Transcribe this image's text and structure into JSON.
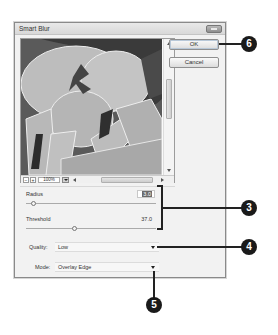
{
  "dialog": {
    "title": "Smart Blur",
    "buttons": {
      "ok": "OK",
      "cancel": "Cancel"
    }
  },
  "preview": {
    "zoom_out": "−",
    "zoom_in": "+",
    "zoom_level": "100%"
  },
  "options": {
    "radius": {
      "label": "Radius",
      "value": "3.0",
      "slider_percent": 6
    },
    "threshold": {
      "label": "Threshold",
      "value": "37.0",
      "slider_percent": 37
    },
    "quality": {
      "label": "Quality:",
      "value": "Low"
    },
    "mode": {
      "label": "Mode:",
      "value": "Overlay Edge"
    }
  },
  "callouts": [
    {
      "number": "3",
      "target": "radius-threshold-group"
    },
    {
      "number": "4",
      "target": "quality-dropdown"
    },
    {
      "number": "5",
      "target": "mode-dropdown"
    },
    {
      "number": "6",
      "target": "ok-button"
    }
  ],
  "colors": {
    "dialog_bg": "#f2f2f2",
    "callout_bg": "#1a1a1a",
    "selection": "#6b6b6b"
  }
}
